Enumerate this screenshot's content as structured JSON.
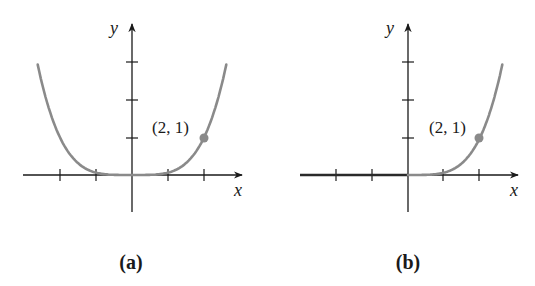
{
  "colors": {
    "curve": "#8a8a8a",
    "axis": "#1a1a1a",
    "background": "#ffffff"
  },
  "panels": [
    {
      "caption": "(a)",
      "x_label": "x",
      "y_label": "y",
      "point_label": "(2, 1)"
    },
    {
      "caption": "(b)",
      "x_label": "x",
      "y_label": "y",
      "point_label": "(2, 1)"
    }
  ],
  "chart_data": [
    {
      "type": "line",
      "title": "(a)",
      "xlabel": "x",
      "ylabel": "y",
      "function": "y = x^4 / 16",
      "xlim": [
        -3,
        3
      ],
      "ylim": [
        -1,
        4
      ],
      "x_ticks": [
        -2,
        -1,
        1,
        2
      ],
      "y_ticks": [
        1,
        2,
        3
      ],
      "x": [
        -2.6,
        -2,
        -1.5,
        -1,
        -0.5,
        0,
        0.5,
        1,
        1.5,
        2,
        2.6
      ],
      "y": [
        2.86,
        1.0,
        0.32,
        0.06,
        0.0,
        0.0,
        0.0,
        0.06,
        0.32,
        1.0,
        2.86
      ],
      "annotations": [
        {
          "x": 2,
          "y": 1,
          "label": "(2, 1)",
          "marker": "dot"
        }
      ],
      "grid": false
    },
    {
      "type": "line",
      "title": "(b)",
      "xlabel": "x",
      "ylabel": "y",
      "function": "y = 0 for x < 0, y = x^4 / 16 for x >= 0",
      "xlim": [
        -3,
        3
      ],
      "ylim": [
        -1,
        4
      ],
      "x_ticks": [
        -2,
        -1,
        1,
        2
      ],
      "y_ticks": [
        1,
        2,
        3
      ],
      "x": [
        -3,
        -2,
        -1,
        0,
        0.5,
        1,
        1.5,
        2,
        2.6
      ],
      "y": [
        0,
        0,
        0,
        0,
        0.0,
        0.06,
        0.32,
        1.0,
        2.86
      ],
      "annotations": [
        {
          "x": 2,
          "y": 1,
          "label": "(2, 1)",
          "marker": "dot"
        }
      ],
      "grid": false
    }
  ]
}
